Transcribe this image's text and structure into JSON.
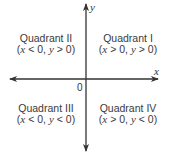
{
  "diagram": {
    "type": "coordinate-plane-quadrants",
    "axes": {
      "x_label": "x",
      "y_label": "y",
      "origin_label": "0",
      "line_color": "#333333"
    },
    "quadrants": [
      {
        "id": "I",
        "title": "Quadrant I",
        "x_var": "x",
        "x_op": ">",
        "y_var": "y",
        "y_op": ">",
        "value": "0",
        "condition": "(x > 0, y > 0)"
      },
      {
        "id": "II",
        "title": "Quadrant II",
        "x_var": "x",
        "x_op": "<",
        "y_var": "y",
        "y_op": ">",
        "value": "0",
        "condition": "(x < 0, y > 0)"
      },
      {
        "id": "III",
        "title": "Quadrant III",
        "x_var": "x",
        "x_op": "<",
        "y_var": "y",
        "y_op": "<",
        "value": "0",
        "condition": "(x < 0, y < 0)"
      },
      {
        "id": "IV",
        "title": "Quadrant IV",
        "x_var": "x",
        "x_op": ">",
        "y_var": "y",
        "y_op": "<",
        "value": "0",
        "condition": "(x > 0, y < 0)"
      }
    ]
  }
}
